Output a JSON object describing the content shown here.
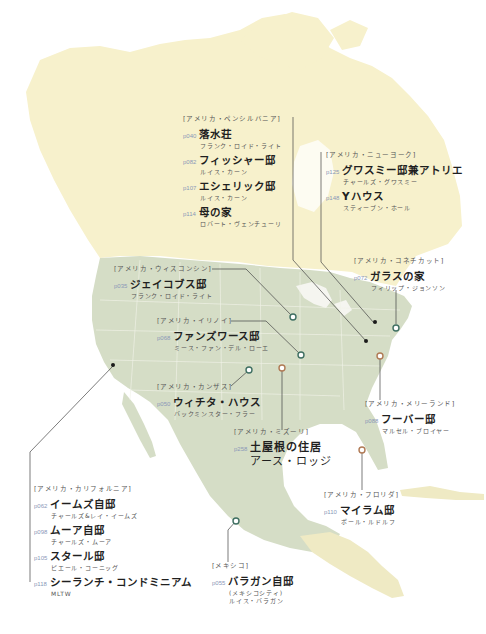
{
  "map": {
    "subject": "North America",
    "colors": {
      "canada_land": "#f6f0c8",
      "us_mexico_land": "#d4dcc4",
      "central_america_land": "#efeac4",
      "water": "#ffffff",
      "state_borders": "#eef0e6",
      "marker_green": "#3f6f62",
      "marker_orange": "#b07a55",
      "marker_black": "#1a1a1a",
      "leader_line": "#444444",
      "page_number": "#8a98b8"
    }
  },
  "groups": {
    "pennsylvania": {
      "region": "[アメリカ・ペンシルバニア]",
      "entries": [
        {
          "page": "p040",
          "title": "落水荘",
          "architect": "フランク・ロイド・ライト"
        },
        {
          "page": "p082",
          "title": "フィッシャー邸",
          "architect": "ルイス・カーン"
        },
        {
          "page": "p107",
          "title": "エシェリック邸",
          "architect": "ルイス・カーン"
        },
        {
          "page": "p114",
          "title": "母の家",
          "architect": "ロバート・ヴェンチューリ"
        }
      ]
    },
    "newyork": {
      "region": "[アメリカ・ニューヨーク]",
      "entries": [
        {
          "page": "p125",
          "title": "グワスミー邸兼アトリエ",
          "architect": "チャールズ・グワスミー"
        },
        {
          "page": "p148",
          "title": "Yハウス",
          "architect": "スティーブン・ホール"
        }
      ]
    },
    "connecticut": {
      "region": "[アメリカ・コネチカット]",
      "entries": [
        {
          "page": "p072",
          "title": "ガラスの家",
          "architect": "フィリップ・ジョンソン"
        }
      ]
    },
    "wisconsin": {
      "region": "[アメリカ・ウィスコンシン]",
      "entries": [
        {
          "page": "p035",
          "title": "ジェイコブス邸",
          "architect": "フランク・ロイド・ライト"
        }
      ]
    },
    "illinois": {
      "region": "[アメリカ・イリノイ]",
      "entries": [
        {
          "page": "p068",
          "title": "ファンズワース邸",
          "architect": "ミース・ファン・デル・ローエ"
        }
      ]
    },
    "kansas": {
      "region": "[アメリカ・カンザス]",
      "entries": [
        {
          "page": "p050",
          "title": "ウィチタ・ハウス",
          "architect": "バックミンスター・フラー"
        }
      ]
    },
    "missouri": {
      "region": "[アメリカ・ミズーリ]",
      "entries": [
        {
          "page": "p258",
          "title": "土屋根の住居",
          "architect": "アース・ロッジ"
        }
      ]
    },
    "maryland": {
      "region": "[アメリカ・メリーランド]",
      "entries": [
        {
          "page": "p088",
          "title": "フーバー邸",
          "architect": "マルセル・ブロイヤー"
        }
      ]
    },
    "california": {
      "region": "[アメリカ・カリフォルニア]",
      "entries": [
        {
          "page": "p062",
          "title": "イームズ自邸",
          "architect": "チャールズ&レイ・イームズ"
        },
        {
          "page": "p098",
          "title": "ムーア自邸",
          "architect": "チャールズ・ムーア"
        },
        {
          "page": "p105",
          "title": "スタール邸",
          "architect": "ピエール・コーニッグ"
        },
        {
          "page": "p118",
          "title": "シーランチ・コンドミニアム",
          "architect": "MLTW"
        }
      ]
    },
    "florida": {
      "region": "[アメリカ・フロリダ]",
      "entries": [
        {
          "page": "p110",
          "title": "マイラム邸",
          "architect": "ポール・ルドルフ"
        }
      ]
    },
    "mexico": {
      "region": "[メキシコ]",
      "entries": [
        {
          "page": "p055",
          "title": "バラガン自邸",
          "note": "(メキシコシティ)",
          "architect": "ルイス・バラガン"
        }
      ]
    }
  }
}
